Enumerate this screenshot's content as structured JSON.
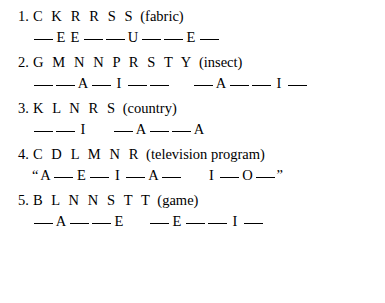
{
  "worksheet": {
    "items": [
      {
        "number": "1.",
        "consonants": "C K R R S S",
        "category": "(fabric)",
        "quoted": false,
        "groups": [
          [
            "_",
            "E",
            "E",
            "_",
            "_",
            "U",
            "_",
            "_",
            "E",
            "_"
          ]
        ]
      },
      {
        "number": "2.",
        "consonants": "G M N N P R S T Y",
        "category": "(insect)",
        "quoted": false,
        "groups": [
          [
            "_",
            "_",
            "A",
            "_",
            "I",
            "_",
            "_"
          ],
          [
            "_",
            "A",
            "_",
            "_",
            "I",
            "_"
          ]
        ]
      },
      {
        "number": "3.",
        "consonants": "K L N R S",
        "category": "(country)",
        "quoted": false,
        "groups": [
          [
            "_",
            "_",
            "I"
          ],
          [
            "_",
            "A",
            "_",
            "_",
            "A"
          ]
        ]
      },
      {
        "number": "4.",
        "consonants": "C D L M N R",
        "category": "(television program)",
        "quoted": true,
        "open_quote": "“",
        "close_quote": "”",
        "groups": [
          [
            "A",
            "_",
            "E",
            "_",
            "I",
            "_",
            "A",
            "_"
          ],
          [
            "I",
            "_",
            "O",
            "_"
          ]
        ]
      },
      {
        "number": "5.",
        "consonants": "B L N N S T T",
        "category": "(game)",
        "quoted": false,
        "groups": [
          [
            "_",
            "A",
            "_",
            "_",
            "E"
          ],
          [
            "_",
            "E",
            "_",
            "_",
            "I",
            "_"
          ]
        ]
      }
    ]
  }
}
